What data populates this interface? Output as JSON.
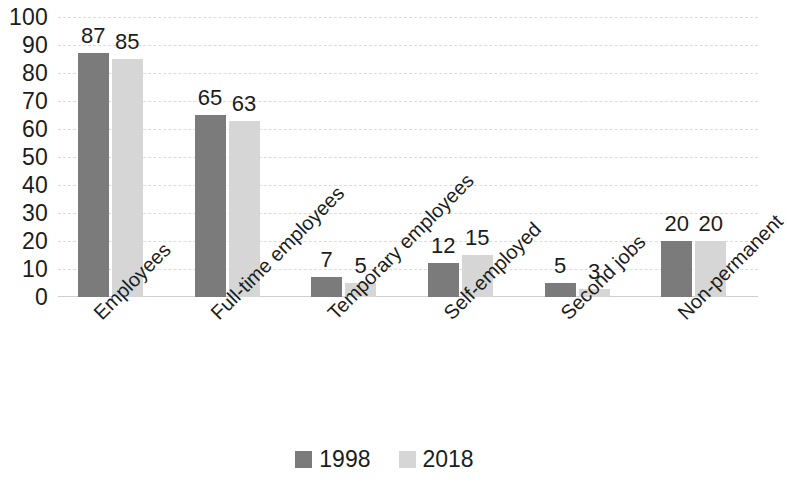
{
  "chart_data": {
    "type": "bar",
    "title": "",
    "subtitle": "",
    "xlabel": "",
    "ylabel": "",
    "ylim": [
      0,
      100
    ],
    "ytick_step": 10,
    "yticks": [
      100,
      90,
      80,
      70,
      60,
      50,
      40,
      30,
      20,
      10,
      0
    ],
    "grid": true,
    "grid_axis": "y",
    "legend_position": "bottom-center",
    "categories": [
      "Employees",
      "Full-time employees",
      "Temporary employees",
      "Self-employed",
      "Second jobs",
      "Non-permanent"
    ],
    "series": [
      {
        "name": "1998",
        "color": "#7b7b7b",
        "values": [
          87,
          65,
          7,
          12,
          5,
          20
        ]
      },
      {
        "name": "2018",
        "color": "#d6d6d6",
        "values": [
          85,
          63,
          5,
          15,
          3,
          20
        ]
      }
    ],
    "data_labels": true,
    "x_label_rotation": -45
  },
  "legend": {
    "items": [
      {
        "label": "1998",
        "color": "#7b7b7b"
      },
      {
        "label": "2018",
        "color": "#d6d6d6"
      }
    ]
  }
}
